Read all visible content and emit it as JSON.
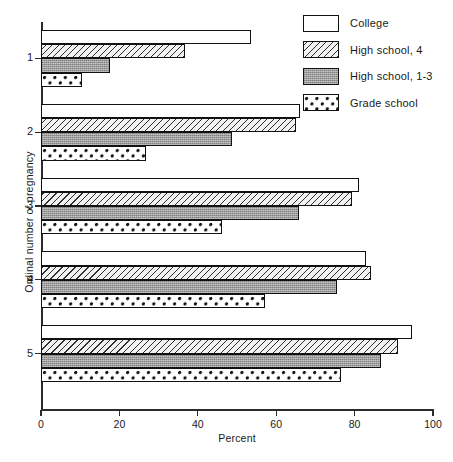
{
  "chart_data": {
    "type": "bar",
    "orientation": "horizontal",
    "title": "",
    "xlabel": "Percent",
    "ylabel": "Ordinal number of pregnancy",
    "xlim": [
      0,
      100
    ],
    "xticks": [
      0,
      20,
      40,
      60,
      80,
      100
    ],
    "categories": [
      "1",
      "2",
      "3",
      "4",
      "5"
    ],
    "grid": false,
    "legend_position": "top-right",
    "series": [
      {
        "name": "College",
        "pattern": "white",
        "values": [
          53.6,
          66.0,
          81.0,
          83.0,
          94.6
        ]
      },
      {
        "name": "High school, 4",
        "pattern": "diagonal",
        "values": [
          36.7,
          65.0,
          79.3,
          84.2,
          91.0
        ]
      },
      {
        "name": "High school, 1-3",
        "pattern": "gray",
        "values": [
          17.6,
          48.7,
          65.8,
          75.5,
          86.7
        ]
      },
      {
        "name": "Grade school",
        "pattern": "dotted",
        "values": [
          10.5,
          26.8,
          46.2,
          57.1,
          76.5
        ]
      }
    ]
  },
  "axis": {
    "x_title": "Percent",
    "y_title": "Ordinal number of pregnancy",
    "x_tick_labels": [
      "0",
      "20",
      "40",
      "60",
      "80",
      "100"
    ],
    "y_tick_labels": [
      "1",
      "2",
      "3",
      "4",
      "5"
    ]
  },
  "legend": {
    "items": [
      {
        "label": "College"
      },
      {
        "label": "High school, 4"
      },
      {
        "label": "High school, 1-3"
      },
      {
        "label": "Grade school"
      }
    ]
  },
  "caption": ""
}
